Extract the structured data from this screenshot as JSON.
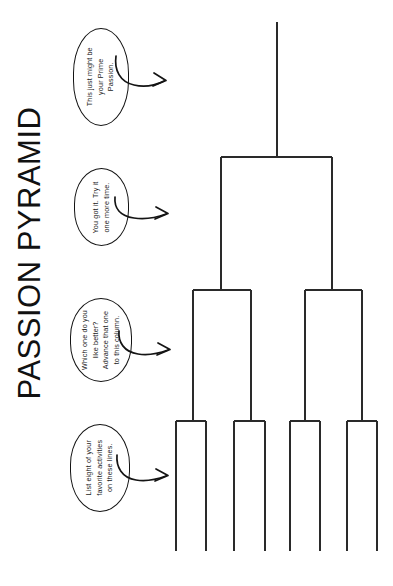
{
  "page": {
    "title": "PASSION PYRAMID",
    "background_color": "#ffffff",
    "ink_color": "#141414"
  },
  "callouts": [
    {
      "id": "prime-passion",
      "lines": [
        "This just might be",
        "your Prime",
        "Passion."
      ],
      "arrow": "curved-arrow-right",
      "points_to": "final-line"
    },
    {
      "id": "round-three",
      "lines": [
        "You got it. Try it",
        "one more time."
      ],
      "arrow": "curved-arrow-right",
      "points_to": "round-3-bracket"
    },
    {
      "id": "round-two",
      "lines": [
        "Which one do you",
        "like better?",
        "Advance that one",
        "to this column."
      ],
      "arrow": "curved-arrow-right",
      "points_to": "round-2-brackets"
    },
    {
      "id": "round-one",
      "lines": [
        "List eight of your",
        "favorite activities",
        "on these lines."
      ],
      "arrow": "curved-arrow-right",
      "points_to": "entry-lines"
    }
  ],
  "bracket": {
    "type": "single-elimination-pyramid",
    "direction": "bottom-to-top",
    "entry_line_count": 8,
    "rounds": [
      {
        "name": "Entry lines",
        "slots": 8
      },
      {
        "name": "Round 1 winners",
        "slots": 4
      },
      {
        "name": "Round 2 winners",
        "slots": 2
      },
      {
        "name": "Prime Passion",
        "slots": 1
      }
    ],
    "entry_line_x": [
      176,
      206,
      234,
      265,
      290,
      320,
      347,
      377
    ],
    "entry_line_top": 421,
    "entry_line_bottom": 551,
    "round1_bar_y": 421,
    "round1_bars": [
      {
        "left": 176,
        "right": 206,
        "stem_x": 193
      },
      {
        "left": 234,
        "right": 265,
        "stem_x": 251
      },
      {
        "left": 290,
        "right": 320,
        "stem_x": 305
      },
      {
        "left": 347,
        "right": 377,
        "stem_x": 362
      }
    ],
    "round2_bar_y": 290,
    "round2_bars": [
      {
        "left": 193,
        "right": 251,
        "stem_x": 221
      },
      {
        "left": 305,
        "right": 362,
        "stem_x": 332
      }
    ],
    "round3_bar_y": 157,
    "round3_bars": [
      {
        "left": 221,
        "right": 332,
        "stem_x": 277
      }
    ],
    "final_stem": {
      "x": 277,
      "top": 22,
      "bottom": 157
    }
  }
}
